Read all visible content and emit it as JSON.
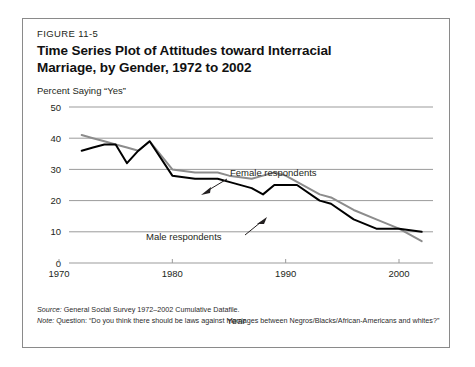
{
  "figure": {
    "number": "FIGURE 11-5",
    "title": "Time Series Plot of Attitudes toward Interracial Marriage, by Gender, 1972 to 2002",
    "title_line1": "Time Series Plot of Attitudes toward Interracial",
    "title_line2": "Marriage, by Gender, 1972 to 2002"
  },
  "footnotes": {
    "source_key": "Source:",
    "source_text": " General Social Survey 1972–2002 Cumulative Datafile.",
    "note_key": "Note:",
    "note_text": " Question: “Do you think there should be laws against marriages between Negros/Blacks/African-Americans and whites?”"
  },
  "chart_data": {
    "type": "line",
    "title": "Time Series Plot of Attitudes toward Interracial Marriage, by Gender, 1972 to 2002",
    "xlabel": "Year",
    "ylabel": "Percent Saying “Yes”",
    "xlim": [
      1970,
      2003
    ],
    "ylim": [
      0,
      50
    ],
    "xticks": [
      1970,
      1980,
      1990,
      2000
    ],
    "xticklabels": [
      "1970",
      "1980",
      "1990",
      "2000"
    ],
    "yticks": [
      0,
      10,
      20,
      30,
      40,
      50
    ],
    "yticklabels": [
      "0",
      "10",
      "20",
      "30",
      "40",
      "50"
    ],
    "grid": "horizontal",
    "legend_position": "inline-annotations",
    "annotations": [
      {
        "text": "Female respondents",
        "series": "Female respondents"
      },
      {
        "text": "Male respondents",
        "series": "Male respondents"
      }
    ],
    "series": [
      {
        "name": "Male respondents",
        "color": "#000000",
        "x": [
          1972,
          1973,
          1974,
          1975,
          1976,
          1977,
          1978,
          1980,
          1982,
          1984,
          1985,
          1987,
          1988,
          1989,
          1990,
          1991,
          1993,
          1994,
          1996,
          1998,
          2000,
          2002
        ],
        "values": [
          36,
          37,
          38,
          38,
          32,
          36,
          39,
          28,
          27,
          27,
          26,
          24,
          22,
          25,
          25,
          25,
          20,
          19,
          14,
          11,
          11,
          10
        ]
      },
      {
        "name": "Female respondents",
        "color": "#8c8c8c",
        "x": [
          1972,
          1973,
          1974,
          1975,
          1976,
          1977,
          1978,
          1980,
          1982,
          1984,
          1985,
          1987,
          1988,
          1989,
          1990,
          1991,
          1993,
          1994,
          1996,
          1998,
          2000,
          2002
        ],
        "values": [
          41,
          40,
          39,
          38,
          37,
          36,
          39,
          30,
          29,
          29,
          28,
          27,
          28,
          29,
          28,
          26,
          22,
          21,
          17,
          14,
          11,
          7
        ]
      }
    ]
  }
}
